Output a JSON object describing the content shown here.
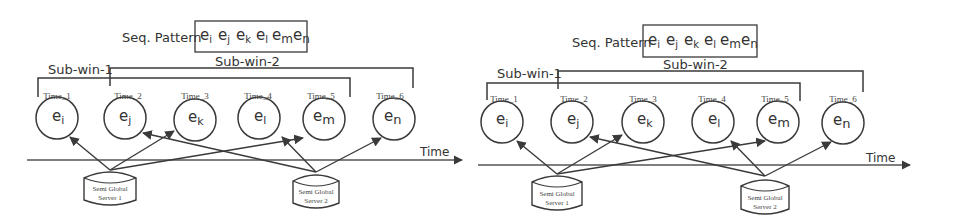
{
  "diagrams": [
    {
      "id": "left",
      "seq_pattern": {
        "label": "Seq. Pattern",
        "events": [
          {
            "base": "e",
            "sub": "i"
          },
          {
            "base": "e",
            "sub": "j"
          },
          {
            "base": "e",
            "sub": "k"
          },
          {
            "base": "e",
            "sub": "l"
          },
          {
            "base": "e",
            "sub": "m"
          },
          {
            "base": "e",
            "sub": "n"
          }
        ]
      },
      "sub_windows": [
        {
          "label": "Sub-win-1",
          "span": "Time_1 to Time_5"
        },
        {
          "label": "Sub-win-2",
          "span": "Time_2 to Time_6"
        }
      ],
      "time_slots": [
        {
          "label": "Time_1",
          "event_base": "e",
          "event_sub": "i",
          "server": "Semi Global Server 1"
        },
        {
          "label": "Time_2",
          "event_base": "e",
          "event_sub": "j",
          "server": "Semi Global Server 2"
        },
        {
          "label": "Time_3",
          "event_base": "e",
          "event_sub": "k",
          "server": "Semi Global Server 1"
        },
        {
          "label": "Time_4",
          "event_base": "e",
          "event_sub": "l",
          "server": "Semi Global Server 2"
        },
        {
          "label": "Time_5",
          "event_base": "e",
          "event_sub": "m",
          "server": "Semi Global Server 1"
        },
        {
          "label": "Time_6",
          "event_base": "e",
          "event_sub": "n",
          "server": "Semi Global Server 2"
        }
      ],
      "axis_label": "Time",
      "servers": [
        {
          "line1": "Semi Global",
          "line2": "Server 1"
        },
        {
          "line1": "Semi Global",
          "line2": "Server 2"
        }
      ]
    },
    {
      "id": "right",
      "seq_pattern": {
        "label": "Seq. Pattern",
        "events": [
          {
            "base": "e",
            "sub": "i"
          },
          {
            "base": "e",
            "sub": "j"
          },
          {
            "base": "e",
            "sub": "k"
          },
          {
            "base": "e",
            "sub": "l"
          },
          {
            "base": "e",
            "sub": "m"
          },
          {
            "base": "e",
            "sub": "n"
          }
        ]
      },
      "sub_windows": [
        {
          "label": "Sub-win-1",
          "span": "Time_1 to Time_5"
        },
        {
          "label": "Sub-win-2",
          "span": "Time_2 to Time_6"
        }
      ],
      "time_slots": [
        {
          "label": "Time_1",
          "event_base": "e",
          "event_sub": "i",
          "server": "Semi Global Server 1"
        },
        {
          "label": "Time_2",
          "event_base": "e",
          "event_sub": "j",
          "server": "Semi Global Server 2"
        },
        {
          "label": "Time_3",
          "event_base": "e",
          "event_sub": "k",
          "server": "Semi Global Server 1"
        },
        {
          "label": "Time_4",
          "event_base": "e",
          "event_sub": "l",
          "server": "Semi Global Server 2"
        },
        {
          "label": "Time_5",
          "event_base": "e",
          "event_sub": "m",
          "server": "Semi Global Server 1"
        },
        {
          "label": "Time_6",
          "event_base": "e",
          "event_sub": "n",
          "server": "Semi Global Server 2"
        }
      ],
      "axis_label": "Time",
      "servers": [
        {
          "line1": "Semi Global",
          "line2": "Server 1"
        },
        {
          "line1": "Semi Global",
          "line2": "Server 2"
        }
      ]
    }
  ]
}
